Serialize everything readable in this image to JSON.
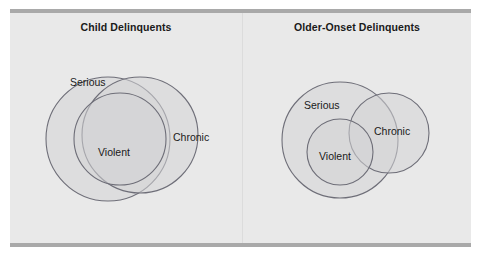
{
  "figure": {
    "background_color": "#e9e9e9",
    "rule_color": "#a9a9a9",
    "page_color": "#ffffff",
    "divider_color": "#dcdcdc"
  },
  "style": {
    "circle_stroke": "#6e6e78",
    "circle_fill": "#d3d3d6",
    "label_color": "#1a1a1a"
  },
  "panels": [
    {
      "id": "child-delinquents",
      "title": "Child Delinquents",
      "labels": {
        "serious": "Serious",
        "chronic": "Chronic",
        "violent": "Violent"
      }
    },
    {
      "id": "older-onset-delinquents",
      "title": "Older-Onset Delinquents",
      "labels": {
        "serious": "Serious",
        "chronic": "Chronic",
        "violent": "Violent"
      }
    }
  ],
  "chart_data": {
    "type": "venn",
    "title": "",
    "sets": [
      "Serious",
      "Violent",
      "Chronic"
    ],
    "diagrams": [
      {
        "name": "Child Delinquents",
        "overlap": "near-complete",
        "circles": [
          {
            "set": "Serious",
            "cx": 98,
            "cy": 126,
            "r": 62
          },
          {
            "set": "Chronic",
            "cx": 130,
            "cy": 122,
            "r": 58
          },
          {
            "set": "Violent",
            "cx": 110,
            "cy": 126,
            "r": 46
          }
        ],
        "label_positions": [
          {
            "set": "Serious",
            "x": 60,
            "y": 73
          },
          {
            "set": "Chronic",
            "x": 163,
            "y": 128
          },
          {
            "set": "Violent",
            "x": 88,
            "y": 143
          }
        ]
      },
      {
        "name": "Older-Onset Delinquents",
        "overlap": "partial",
        "circles": [
          {
            "set": "Serious",
            "cx": 97,
            "cy": 127,
            "r": 58
          },
          {
            "set": "Chronic",
            "cx": 146,
            "cy": 120,
            "r": 40
          },
          {
            "set": "Violent",
            "cx": 97,
            "cy": 139,
            "r": 33
          }
        ],
        "label_positions": [
          {
            "set": "Serious",
            "x": 61,
            "y": 96
          },
          {
            "set": "Chronic",
            "x": 131,
            "y": 122
          },
          {
            "set": "Violent",
            "x": 76,
            "y": 147
          }
        ]
      }
    ]
  }
}
